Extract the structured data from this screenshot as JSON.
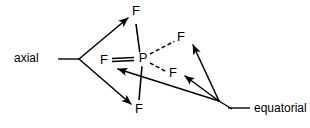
{
  "figure": {
    "background": "#ffffff",
    "stroke_color": "#000000",
    "width": 310,
    "height": 128
  },
  "atoms": {
    "center": {
      "symbol": "P",
      "x": 143,
      "y": 59
    },
    "fluorines": [
      {
        "id": "f-axial-top",
        "symbol": "F",
        "x": 136,
        "y": 12,
        "position_type": "axial"
      },
      {
        "id": "f-axial-bottom",
        "symbol": "F",
        "x": 139,
        "y": 110,
        "position_type": "axial"
      },
      {
        "id": "f-equatorial-left",
        "symbol": "F",
        "x": 104,
        "y": 61,
        "position_type": "equatorial"
      },
      {
        "id": "f-equatorial-upper-right",
        "symbol": "F",
        "x": 181,
        "y": 38,
        "position_type": "equatorial"
      },
      {
        "id": "f-equatorial-lower-right",
        "symbol": "F",
        "x": 173,
        "y": 74,
        "position_type": "equatorial"
      }
    ]
  },
  "bonds": [
    {
      "id": "bond-p-f-axial-top",
      "from": "P",
      "to": "F",
      "style": "plain-line",
      "d": "M 136,24 L 140,54"
    },
    {
      "id": "bond-p-f-axial-bottom",
      "from": "P",
      "to": "F",
      "style": "plain-line",
      "d": "M 142,66 L 139,100"
    },
    {
      "id": "bond-p-f-equatorial-left",
      "from": "P",
      "to": "F",
      "style": "bold-wedge",
      "d": "M 134,59 L 112,60"
    },
    {
      "id": "bond-p-f-equatorial-upper-right",
      "from": "P",
      "to": "F",
      "style": "dashed",
      "d": "M 150,54 L 175,41"
    },
    {
      "id": "bond-p-f-equatorial-lower-right",
      "from": "P",
      "to": "F",
      "style": "dashed",
      "d": "M 150,63 L 167,72"
    }
  ],
  "annotations": {
    "axial": {
      "id": "axial-annotation",
      "label": "axial",
      "label_x": 14,
      "label_y": 59,
      "leader": "M 58,59 L 79,59",
      "fork_origin": {
        "x": 79,
        "y": 59
      },
      "arrows": [
        {
          "id": "axial-arrow-to-top-f",
          "target": "f-axial-top",
          "d": "M 79,59 L 128,18"
        },
        {
          "id": "axial-arrow-to-bottom-f",
          "target": "f-axial-bottom",
          "d": "M 79,59 L 131,104"
        }
      ]
    },
    "equatorial": {
      "id": "equatorial-annotation",
      "label": "equatorial",
      "label_x": 236,
      "label_y": 109,
      "leader": "M 219,101 L 232,109",
      "fork_origin": {
        "x": 219,
        "y": 101
      },
      "arrows": [
        {
          "id": "equatorial-arrow-to-upper-right-f",
          "target": "f-equatorial-upper-right",
          "d": "M 219,101 L 193,45"
        },
        {
          "id": "equatorial-arrow-to-lower-right-f",
          "target": "f-equatorial-lower-right",
          "d": "M 219,101 L 185,76"
        },
        {
          "id": "equatorial-arrow-to-left-f",
          "target": "f-equatorial-left",
          "d": "M 219,101 L 118,69"
        }
      ]
    }
  }
}
